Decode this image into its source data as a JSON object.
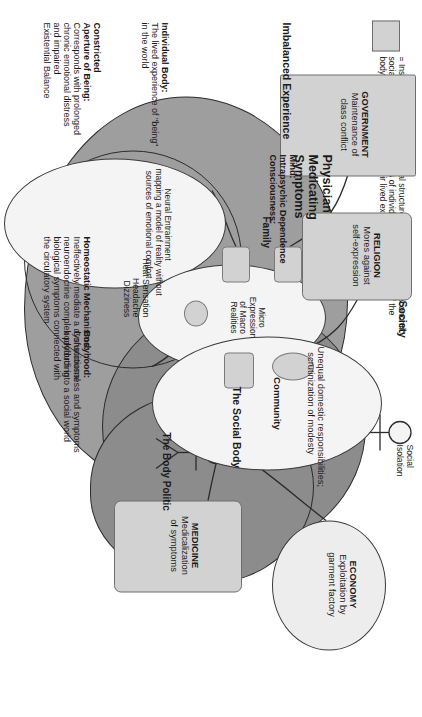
{
  "legend": {
    "swatch_color": "#d2d2d2",
    "text": "= Institutions of secondary social structure regulate against the economic,\nsocial, and psychological needs of individuals. The hegemony of the\nbody politic presses against their lived experience."
  },
  "figure": {
    "title_left": "Imbalanced Experience",
    "central_label": "Physician\nMedicating\nSymptoms",
    "domains": {
      "social_body": "The Social Body",
      "body_politic": "The Body Politic",
      "society": "Society",
      "family": "Family",
      "community": "Community"
    },
    "annotations": {
      "social_isolation": "Social\nIsolation",
      "body_symptoms": "Heat Sensation\nHeadache\nDizziness",
      "mind_symptoms": "Crying\nScreaming"
    }
  },
  "blocks": {
    "individual_body": {
      "heading": "Individual Body:",
      "body": "The lived experience of \"being\"\nin the world"
    },
    "constricted": {
      "heading": "Constricted\nAperture of Being:",
      "body": "Corresponds with prolonged\nchronic emotional distress\nand impaired\nExistential Balance"
    },
    "homeostatic": {
      "heading": "Homeostatic Mechanisms:",
      "body": "Ineffectively mediate a dysfunctional\nneuroendocrine complex producing\nbiological symptoms connected with\nthe circulatory system"
    },
    "mind": {
      "heading": "Mind:",
      "body": "Intrapsychic Dependence\nConsciousness:"
    },
    "bodyhood": {
      "heading": "Bodyhood:",
      "body": "Consciousness and symptoms\nbodyforth into a social world"
    }
  },
  "ellipses": {
    "neural_entrainment": "Neural Entrainment\nmapping a model of reality without\nsources of emotional comfort",
    "micro_expression": "Micro\nExpression\nof Macro\nRealities",
    "community_detail": "Unequal domestic responsibilities;\nscrutinization of modesty"
  },
  "institutions": [
    {
      "name": "GOVERNMENT",
      "detail": "Maintenance of\nclass conflict"
    },
    {
      "name": "RELIGION",
      "detail": "Mores against\nself-expression"
    },
    {
      "name": "MEDICINE",
      "detail": "Medicalization\nof symptoms"
    },
    {
      "name": "ECONOMY",
      "detail": "Exploitation by\ngarment factory"
    }
  ],
  "colors": {
    "head_outer": "#9e9e9e",
    "head_social": "#8c8c8c",
    "institution_box": "#d2d2d2",
    "ellipse_fill": "#f4f4f4",
    "stroke": "#2b2b2b"
  }
}
